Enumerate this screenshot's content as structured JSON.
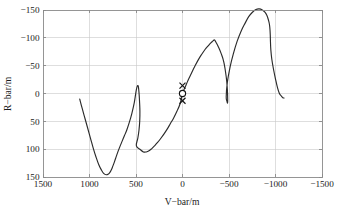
{
  "chart_data": {
    "type": "line",
    "title": "",
    "xlabel": "V−bar/m",
    "ylabel": "R−bar/m",
    "xticks": [
      1500,
      1000,
      500,
      0,
      -500,
      -1000,
      -1500
    ],
    "xticklabels": [
      "1500",
      "1000",
      "500",
      "0",
      "−500",
      "−1000",
      "−1500"
    ],
    "yticks": [
      -150,
      -100,
      -50,
      0,
      50,
      100,
      150
    ],
    "yticklabels": [
      "−150",
      "−100",
      "−50",
      "0",
      "50",
      "100",
      "150"
    ],
    "xlim": [
      1500,
      -1500
    ],
    "ylim": [
      -150,
      150
    ],
    "x_axis_direction": "reverse",
    "y_axis_direction": "reverse",
    "grid": true,
    "legend": null,
    "legend_position": "none",
    "background": "#ffffff",
    "series": [
      {
        "name": "relative trajectory",
        "style": "solid line",
        "color": "#2b2b2b",
        "x": [
          1105,
          1080,
          1050,
          1020,
          990,
          960,
          930,
          900,
          870,
          845,
          820,
          800,
          782,
          765,
          748,
          730,
          712,
          693,
          672,
          650,
          625,
          600,
          572,
          545,
          518,
          495,
          478,
          468,
          462,
          458,
          460,
          468,
          480,
          496,
          452,
          420,
          390,
          360,
          330,
          300,
          268,
          235,
          200,
          165,
          130,
          95,
          60,
          25,
          0,
          -30,
          -60,
          -95,
          -130,
          -168,
          -205,
          -242,
          -278,
          -305,
          -325,
          -338,
          -345,
          -350,
          -360,
          -385,
          -415,
          -445,
          -470,
          -482,
          -486,
          -484,
          -478,
          -470,
          -482,
          -512,
          -548,
          -588,
          -630,
          -672,
          -712,
          -752,
          -790,
          -825,
          -858,
          -886,
          -908,
          -924,
          -935,
          -941,
          -944,
          -946,
          -950,
          -960,
          -978,
          -1000,
          -1022,
          -1042,
          -1060,
          -1074,
          -1085,
          -1092
        ],
        "y": [
          10,
          26,
          44,
          62,
          80,
          98,
          114,
          128,
          138,
          144,
          146,
          145,
          142,
          137,
          130,
          122,
          113,
          104,
          95,
          86,
          76,
          66,
          52,
          36,
          16,
          -8,
          -14,
          -2,
          14,
          32,
          50,
          66,
          80,
          94,
          101,
          105,
          105,
          103,
          99,
          94,
          88,
          81,
          73,
          64,
          54,
          44,
          32,
          18,
          0,
          -12,
          -24,
          -36,
          -48,
          -60,
          -70,
          -79,
          -86,
          -91,
          -94,
          -96,
          -96,
          -95,
          -92,
          -84,
          -72,
          -56,
          -30,
          -8,
          10,
          17,
          14,
          6,
          -20,
          -48,
          -72,
          -94,
          -112,
          -126,
          -138,
          -146,
          -151,
          -152,
          -150,
          -146,
          -140,
          -132,
          -124,
          -114,
          -104,
          -92,
          -78,
          -62,
          -44,
          -26,
          -10,
          0,
          4,
          7,
          8,
          8
        ]
      }
    ],
    "annotations": [
      {
        "label": "cross-marker-upper",
        "marker": "x",
        "x": 0,
        "y": -14
      },
      {
        "label": "circle-marker-origin",
        "marker": "o",
        "x": 0,
        "y": 0
      },
      {
        "label": "cross-marker-lower",
        "marker": "x",
        "x": 0,
        "y": 13
      }
    ]
  },
  "axes": {
    "x_title": "V−bar/m",
    "y_title": "R−bar/m",
    "x_labels": [
      "1500",
      "1000",
      "500",
      "0",
      "−500",
      "−1000",
      "−1500"
    ],
    "y_labels": [
      "−150",
      "−100",
      "−50",
      "0",
      "50",
      "100",
      "150"
    ]
  },
  "colors": {
    "curve": "#2b2b2b",
    "grid": "#c8c8c8",
    "axis": "#8a8a8a",
    "text": "#1a1a1a",
    "background": "#ffffff"
  }
}
